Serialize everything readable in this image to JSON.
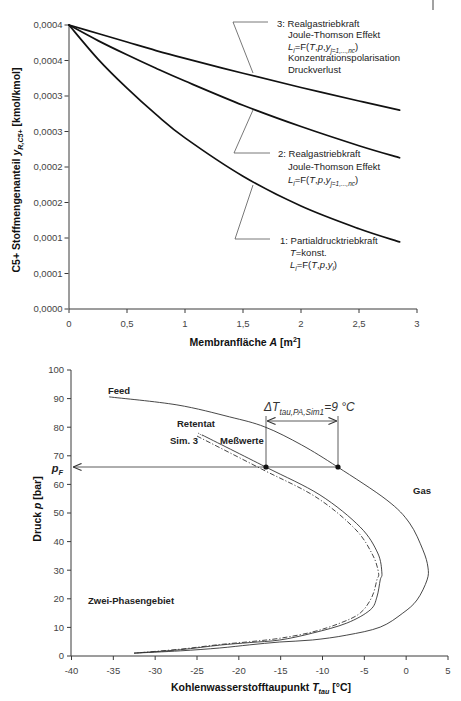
{
  "chart_data": [
    {
      "type": "line",
      "title": "",
      "xlabel": "Membranfläche A [m²]",
      "ylabel": "C5+ Stoffmengenanteil y_R,C5+ [kmol/kmol]",
      "xlabel_rich": [
        {
          "t": "Membranfläche "
        },
        {
          "t": "A",
          "it": true
        },
        {
          "t": "  [m"
        },
        {
          "t": "2",
          "sup": true
        },
        {
          "t": "]"
        }
      ],
      "ylabel_rich": [
        {
          "t": "C5+ Stoffmengenanteil  "
        },
        {
          "t": "y",
          "it": true
        },
        {
          "t": "R,C5+",
          "it": true,
          "sub": true
        },
        {
          "t": "  [kmol/kmol]"
        }
      ],
      "xlim": [
        0,
        3
      ],
      "ylim": [
        0,
        0.0004
      ],
      "grid": false,
      "x_tick_values": [
        0,
        0.5,
        1,
        1.5,
        2,
        2.5,
        3
      ],
      "x_ticks": [
        "0",
        "0,5",
        "1",
        "1,5",
        "2",
        "2,5",
        "3"
      ],
      "y_tick_values": [
        0,
        5e-05,
        0.0001,
        0.00015,
        0.0002,
        0.00025,
        0.0003,
        0.00035,
        0.0004
      ],
      "y_ticks": [
        "0,0000",
        "0,0001",
        "0,0001",
        "0,0002",
        "0,0002",
        "0,0003",
        "0,0003",
        "0,0004",
        "0,0004"
      ],
      "x": [
        0,
        0.25,
        0.5,
        0.75,
        1.0,
        1.5,
        2.0,
        2.5,
        2.85
      ],
      "series": [
        {
          "name": "1: Partialdrucktriebkraft",
          "values": [
            0.0004,
            0.000352,
            0.000311,
            0.000274,
            0.000241,
            0.000187,
            0.000145,
            0.000113,
            9.45e-05
          ]
        },
        {
          "name": "2: Realgastriebkraft",
          "values": [
            0.0004,
            0.000378,
            0.000358,
            0.000339,
            0.000321,
            0.000287,
            0.000257,
            0.00023,
            0.000213
          ]
        },
        {
          "name": "3: Realgastriebkraft",
          "values": [
            0.0004,
            0.000388,
            0.000376,
            0.000364,
            0.000353,
            0.000332,
            0.000312,
            0.000293,
            0.00028
          ]
        }
      ],
      "annotations": [
        {
          "series": "1",
          "lines": [
            [
              {
                "t": "1: Partialdrucktriebkraft"
              }
            ],
            [
              {
                "t": "T",
                "it": true
              },
              {
                "t": "=konst."
              }
            ],
            [
              {
                "t": "L",
                "it": true
              },
              {
                "t": "i",
                "it": true,
                "sub": true
              },
              {
                "t": "=F("
              },
              {
                "t": "T",
                "it": true
              },
              {
                "t": ","
              },
              {
                "t": "p",
                "it": true
              },
              {
                "t": ","
              },
              {
                "t": "y",
                "it": true
              },
              {
                "t": "i",
                "it": true,
                "sub": true
              },
              {
                "t": ")"
              }
            ]
          ]
        },
        {
          "series": "2",
          "lines": [
            [
              {
                "t": "2: Realgastriebkraft"
              }
            ],
            [
              {
                "t": "Joule-Thomson Effekt"
              }
            ],
            [
              {
                "t": "L",
                "it": true
              },
              {
                "t": "i",
                "it": true,
                "sub": true
              },
              {
                "t": "=F("
              },
              {
                "t": "T",
                "it": true
              },
              {
                "t": ","
              },
              {
                "t": "p",
                "it": true
              },
              {
                "t": ","
              },
              {
                "t": "y",
                "it": true
              },
              {
                "t": "j=1,...,nc",
                "it": true,
                "sub": true
              },
              {
                "t": ")"
              }
            ]
          ]
        },
        {
          "series": "3",
          "lines": [
            [
              {
                "t": "3: Realgastriebkraft"
              }
            ],
            [
              {
                "t": "Joule-Thomson Effekt"
              }
            ],
            [
              {
                "t": "L",
                "it": true
              },
              {
                "t": "i",
                "it": true,
                "sub": true
              },
              {
                "t": "=F("
              },
              {
                "t": "T",
                "it": true
              },
              {
                "t": ","
              },
              {
                "t": "p",
                "it": true
              },
              {
                "t": ","
              },
              {
                "t": "y",
                "it": true
              },
              {
                "t": "j=1,...,nc",
                "it": true,
                "sub": true
              },
              {
                "t": ")"
              }
            ],
            [
              {
                "t": "Konzentrationspolarisation"
              }
            ],
            [
              {
                "t": "Druckverlust"
              }
            ]
          ]
        }
      ]
    },
    {
      "type": "line",
      "title": "",
      "xlabel": "Kohlenwasserstofftaupunkt T_tau [°C]",
      "ylabel": "Druck p [bar]",
      "xlabel_rich": [
        {
          "t": "Kohlenwasserstofftaupunkt "
        },
        {
          "t": "T",
          "it": true
        },
        {
          "t": "tau",
          "it": true,
          "sub": true
        },
        {
          "t": " [°C]"
        }
      ],
      "ylabel_rich": [
        {
          "t": "Druck "
        },
        {
          "t": "p",
          "it": true
        },
        {
          "t": " [bar]"
        }
      ],
      "xlim": [
        -40,
        5
      ],
      "ylim": [
        0,
        100
      ],
      "grid": false,
      "x_tick_values": [
        -40,
        -35,
        -30,
        -25,
        -20,
        -15,
        -10,
        -5,
        0,
        5
      ],
      "x_ticks": [
        "-40",
        "-35",
        "-30",
        "-25",
        "-20",
        "-15",
        "-10",
        "-5",
        "0",
        "5"
      ],
      "y_tick_values": [
        0,
        10,
        20,
        30,
        40,
        50,
        60,
        70,
        80,
        90,
        100
      ],
      "y_ticks": [
        "0",
        "10",
        "20",
        "30",
        "40",
        "50",
        "60",
        "70",
        "80",
        "90",
        "100"
      ],
      "series": [
        {
          "name": "Feed",
          "style": "solid",
          "points": [
            [
              -35.5,
              90.6
            ],
            [
              -27.4,
              87.8
            ],
            [
              -21.1,
              83.6
            ],
            [
              -16.9,
              80.1
            ],
            [
              -12.5,
              73.8
            ],
            [
              -8.2,
              66.1
            ],
            [
              -2.3,
              54.5
            ],
            [
              0.4,
              46.5
            ],
            [
              2.0,
              37.1
            ],
            [
              2.6,
              31.1
            ],
            [
              2.5,
              26.6
            ],
            [
              1.3,
              19.6
            ],
            [
              -0.4,
              15.0
            ],
            [
              -3.1,
              10.1
            ],
            [
              -7.1,
              7.3
            ],
            [
              -11.2,
              5.6
            ],
            [
              -15.1,
              4.9
            ],
            [
              -18.7,
              3.9
            ],
            [
              -22.3,
              2.8
            ],
            [
              -27.0,
              1.8
            ],
            [
              -32.5,
              1.0
            ]
          ]
        },
        {
          "name": "Retentat Meßwerte",
          "style": "solid",
          "points": [
            [
              -24.4,
              77.3
            ],
            [
              -16.8,
              66.1
            ],
            [
              -10.3,
              56.3
            ],
            [
              -5.5,
              45.1
            ],
            [
              -3.4,
              36.0
            ],
            [
              -2.9,
              29.0
            ],
            [
              -3.1,
              26.6
            ],
            [
              -3.5,
              20.6
            ],
            [
              -4.3,
              16.1
            ],
            [
              -7.1,
              11.5
            ],
            [
              -11.2,
              8.0
            ],
            [
              -15.1,
              5.6
            ],
            [
              -18.7,
              4.7
            ],
            [
              -22.3,
              3.8
            ],
            [
              -27.0,
              2.2
            ],
            [
              -32.5,
              1.0
            ]
          ]
        },
        {
          "name": "Retentat Sim. 3",
          "style": "dash-dot",
          "points": [
            [
              -25.0,
              76.9
            ],
            [
              -17.3,
              65.4
            ],
            [
              -10.8,
              55.6
            ],
            [
              -6.1,
              44.4
            ],
            [
              -4.0,
              35.3
            ],
            [
              -3.3,
              29.0
            ],
            [
              -3.5,
              26.6
            ],
            [
              -4.1,
              20.6
            ],
            [
              -5.5,
              15.0
            ],
            [
              -7.9,
              11.5
            ],
            [
              -11.2,
              8.4
            ],
            [
              -15.1,
              6.2
            ],
            [
              -18.7,
              5.0
            ],
            [
              -22.3,
              4.0
            ],
            [
              -27.0,
              2.4
            ],
            [
              -32.5,
              1.0
            ]
          ]
        }
      ],
      "markers": [
        {
          "name": "Retentat Meßwerte bei p_F",
          "x": -16.8,
          "y": 66.1
        },
        {
          "name": "Feed bei p_F",
          "x": -8.2,
          "y": 66.1
        }
      ],
      "p_F": 66.1,
      "labels": {
        "feed": "Feed",
        "retentat": "Retentat",
        "sim3": "Sim. 3",
        "messwerte": "Meßwerte",
        "gas": "Gas",
        "two_phase": "Zwei-Phasengebiet",
        "pf_rich": [
          {
            "t": "p",
            "it": true
          },
          {
            "t": "F",
            "it": true,
            "sub": true
          }
        ],
        "delta_t_rich": [
          {
            "t": "Δ"
          },
          {
            "t": "T",
            "it": true
          },
          {
            "t": "tau,PA,Sim1",
            "it": true,
            "sub": true
          },
          {
            "t": "=9 °C",
            "it": true
          }
        ]
      },
      "annotations": [
        {
          "text": "ΔT_tau,PA,Sim1 = 9 °C",
          "from_x": -16.8,
          "to_x": -8.2
        }
      ]
    }
  ]
}
